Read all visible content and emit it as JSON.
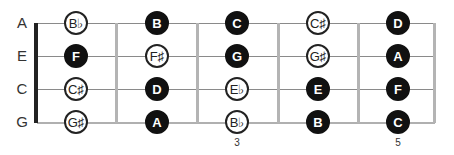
{
  "diagram": {
    "type": "ukulele-fretboard",
    "strings": [
      {
        "label": "A",
        "y": 23
      },
      {
        "label": "E",
        "y": 56
      },
      {
        "label": "C",
        "y": 89
      },
      {
        "label": "G",
        "y": 122
      }
    ],
    "fret_numbers": [
      {
        "label": "3",
        "x": 237
      },
      {
        "label": "5",
        "x": 398
      }
    ],
    "notes": [
      {
        "string": "A",
        "fret": 1,
        "label": "B♭",
        "filled": false
      },
      {
        "string": "A",
        "fret": 2,
        "label": "B",
        "filled": true
      },
      {
        "string": "A",
        "fret": 3,
        "label": "C",
        "filled": true
      },
      {
        "string": "A",
        "fret": 4,
        "label": "C♯",
        "filled": false
      },
      {
        "string": "A",
        "fret": 5,
        "label": "D",
        "filled": true
      },
      {
        "string": "E",
        "fret": 1,
        "label": "F",
        "filled": true
      },
      {
        "string": "E",
        "fret": 2,
        "label": "F♯",
        "filled": false
      },
      {
        "string": "E",
        "fret": 3,
        "label": "G",
        "filled": true
      },
      {
        "string": "E",
        "fret": 4,
        "label": "G♯",
        "filled": false
      },
      {
        "string": "E",
        "fret": 5,
        "label": "A",
        "filled": true
      },
      {
        "string": "C",
        "fret": 1,
        "label": "C♯",
        "filled": false
      },
      {
        "string": "C",
        "fret": 2,
        "label": "D",
        "filled": true
      },
      {
        "string": "C",
        "fret": 3,
        "label": "E♭",
        "filled": false
      },
      {
        "string": "C",
        "fret": 4,
        "label": "E",
        "filled": true
      },
      {
        "string": "C",
        "fret": 5,
        "label": "F",
        "filled": true
      },
      {
        "string": "G",
        "fret": 1,
        "label": "G♯",
        "filled": false
      },
      {
        "string": "G",
        "fret": 2,
        "label": "A",
        "filled": true
      },
      {
        "string": "G",
        "fret": 3,
        "label": "B♭",
        "filled": false
      },
      {
        "string": "G",
        "fret": 4,
        "label": "B",
        "filled": true
      },
      {
        "string": "G",
        "fret": 5,
        "label": "C",
        "filled": true
      }
    ],
    "colors": {
      "filled_note": "#111111",
      "open_note_border": "#222222",
      "fret": "#b4b4b4",
      "nut": "#222222"
    }
  }
}
